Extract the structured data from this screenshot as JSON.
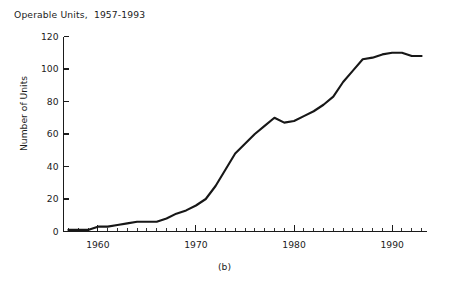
{
  "chart_data": {
    "type": "line",
    "title": "Operable Units,  1957-1993",
    "caption": "(b)",
    "xlabel": "",
    "ylabel": "Number of Units",
    "xlim": [
      1956.5,
      1993.5
    ],
    "ylim": [
      0,
      120
    ],
    "grid": false,
    "legend": null,
    "x_major_ticks": [
      1960,
      1970,
      1980,
      1990
    ],
    "x_major_tick_labels": [
      "1960",
      "1970",
      "1980",
      "1990"
    ],
    "x_minor_tick_step": 1,
    "y_ticks": [
      0,
      20,
      40,
      60,
      80,
      100,
      120
    ],
    "y_tick_labels": [
      "0",
      "20",
      "40",
      "60",
      "80",
      "100",
      "120"
    ],
    "line_color": "#171717",
    "background_color": "#ffffff",
    "series": [
      {
        "name": "Operable Units",
        "x": [
          1957,
          1958,
          1959,
          1960,
          1961,
          1962,
          1963,
          1964,
          1965,
          1966,
          1967,
          1968,
          1969,
          1970,
          1971,
          1972,
          1973,
          1974,
          1975,
          1976,
          1977,
          1978,
          1979,
          1980,
          1981,
          1982,
          1983,
          1984,
          1985,
          1986,
          1987,
          1988,
          1989,
          1990,
          1991,
          1992,
          1993
        ],
        "values": [
          1,
          1,
          1,
          3,
          3,
          4,
          5,
          6,
          6,
          6,
          8,
          11,
          13,
          16,
          20,
          28,
          38,
          48,
          54,
          60,
          65,
          70,
          67,
          68,
          71,
          74,
          78,
          83,
          92,
          99,
          106,
          107,
          109,
          110,
          110,
          108,
          108
        ]
      }
    ]
  }
}
